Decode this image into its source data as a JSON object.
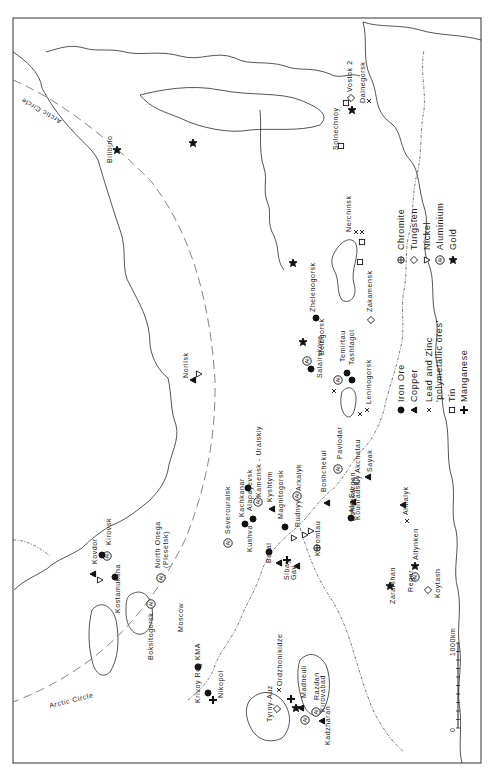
{
  "map": {
    "title": "USSR mineral resources",
    "orientation": "rotated 90deg counter-clockwise",
    "arctic_circle_label": "Arctic Circle",
    "scale": {
      "start": "0",
      "end": "1000km"
    }
  },
  "legend": {
    "column1": [
      {
        "symbol": "filled-circle",
        "label": "Iron Ore"
      },
      {
        "symbol": "filled-triangle",
        "label": "Copper"
      },
      {
        "symbol": "cross-x",
        "label": "Lead and Zinc",
        "label2": "'polymetallic ores'"
      },
      {
        "symbol": "open-square",
        "label": "Tin"
      },
      {
        "symbol": "plus",
        "label": "Manganese"
      }
    ],
    "column2": [
      {
        "symbol": "circle-cross",
        "label": "Chromite"
      },
      {
        "symbol": "open-diamond",
        "label": "Tungsten"
      },
      {
        "symbol": "open-triangle-down",
        "label": "Nickel"
      },
      {
        "symbol": "circled-al",
        "label": "Aluminium"
      },
      {
        "symbol": "star",
        "label": "Gold"
      }
    ]
  },
  "places": {
    "bilibino": "Bilibino",
    "norilsk": "Norilsk",
    "kovdor": "Kovdor",
    "kirovsk": "Kirovsk",
    "kostamuksha": "Kostamuksha",
    "north_onega": "North Onega",
    "plesetsk": "(Plesetsk)",
    "boksitogorsk": "Boksitogorsk",
    "moscow": "Moscow",
    "kma": "KMA",
    "krivoy_rog": "Krivoy Rog",
    "nikopol": "Nikopol",
    "tyrny_auz": "Tyrny-Auz",
    "ordzhonikidze": "Ordzhonikidze",
    "madneuli": "Madneuli",
    "razdan": "Razdan",
    "kirovabad": "Kirovabad",
    "kadzharan": "Kadzharan",
    "severouralsk": "Severouralsk",
    "kachkanar": "Kachkanar",
    "alapayevsk": "Alapayevsk",
    "kamensk_uralskiy": "Kamensk - Uralskiy",
    "kushva": "Kushva",
    "kyshtym": "Kyshtym",
    "magnitogorsk": "Magnitogorsk",
    "bakal": "Bakal",
    "rudnyy": "Rudnyy",
    "sibay": "Sibay",
    "gay": "Gay",
    "khromtau": "Khromtau",
    "arkalyk": "Arkalyk",
    "boshchekul": "Boshchekul",
    "pavlodar": "Pavlodar",
    "akchatau": "Akchatau",
    "sayak": "Sayak",
    "dzhezkazgan": "Dzhezkazgan",
    "ata_su": "Ata-Su",
    "kounradskiy": "Kounradskiy",
    "almalyk": "Almalyk",
    "altynken": "Altynken",
    "regar": "Regar",
    "koytash": "Koytash",
    "zarafshan": "Zarafshan",
    "salairskoye": "Salairskoye",
    "leninogorsk": "Leninogorsk",
    "belogorsk": "Belogorsk",
    "temirtau": "Temirtau",
    "tashtagol": "Tashtagol",
    "zhelenogorsk": "Zhelenogorsk",
    "zakamensk": "Zakamensk",
    "nerchinsk": "Nerchinsk",
    "solnechnoy": "Solnechnoy",
    "vostok2": "Vostok 2",
    "dalnegorsk": "Dalnegorsk"
  }
}
